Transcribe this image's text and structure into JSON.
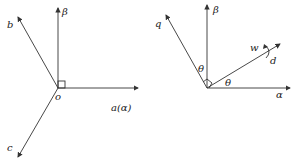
{
  "left_diagram": {
    "origin_label": "o",
    "axes": {
      "beta": "β",
      "a": "a(α)",
      "b": "b",
      "c": "c"
    }
  },
  "right_diagram": {
    "axes": {
      "beta": "β",
      "alpha": "α",
      "q": "q",
      "d": "d"
    },
    "angle_labels": [
      "θ",
      "θ"
    ],
    "rotation_label": "w"
  }
}
